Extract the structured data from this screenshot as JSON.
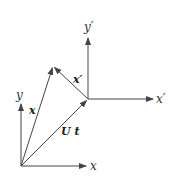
{
  "diagram": {
    "type": "coordinate-frame-vector-diagram",
    "colors": {
      "line": "#444444",
      "text": "#333333",
      "background": "#ffffff"
    },
    "frames": [
      {
        "name": "fixed",
        "origin": [
          21,
          166
        ],
        "x_axis": {
          "end": [
            88,
            166
          ],
          "label": "x"
        },
        "y_axis": {
          "end": [
            21,
            102
          ],
          "label": "y"
        }
      },
      {
        "name": "moving",
        "origin": [
          88,
          99
        ],
        "x_axis": {
          "end": [
            155,
            99
          ],
          "label": "x′"
        },
        "y_axis": {
          "end": [
            88,
            36
          ],
          "label": "y′"
        }
      }
    ],
    "vectors": [
      {
        "name": "position-fixed",
        "from": [
          21,
          166
        ],
        "to": [
          53,
          66
        ],
        "label": "x"
      },
      {
        "name": "translation",
        "from": [
          21,
          166
        ],
        "to": [
          88,
          99
        ],
        "label": "U t"
      },
      {
        "name": "position-moving",
        "from": [
          88,
          99
        ],
        "to": [
          53,
          66
        ],
        "label": "x′"
      }
    ]
  }
}
